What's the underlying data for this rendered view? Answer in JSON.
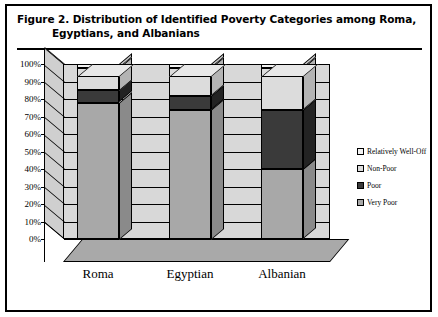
{
  "figure": {
    "title_line1": "Figure 2.  Distribution of Identified Poverty Categories among Roma,",
    "title_line2": "Egyptians, and Albanians"
  },
  "chart_data": {
    "type": "bar",
    "stacked": true,
    "title": "Distribution of Identified Poverty Categories among Roma, Egyptians, and Albanians",
    "xlabel": "",
    "ylabel": "",
    "ylim": [
      0,
      100
    ],
    "y_unit": "%",
    "grid": true,
    "legend_position": "right",
    "categories": [
      "Roma",
      "Egyptian",
      "Albanian"
    ],
    "tick_labels": [
      "0%",
      "10%",
      "20%",
      "30%",
      "40%",
      "50%",
      "60%",
      "70%",
      "80%",
      "90%",
      "100%"
    ],
    "tick_values": [
      0,
      10,
      20,
      30,
      40,
      50,
      60,
      70,
      80,
      90,
      100
    ],
    "series": [
      {
        "name": "Very Poor",
        "color": "#a8a8a8",
        "values": [
          78,
          74,
          40
        ]
      },
      {
        "name": "Poor",
        "color": "#3a3a3a",
        "values": [
          7,
          8,
          34
        ]
      },
      {
        "name": "Non-Poor",
        "color": "#dcdcdc",
        "values": [
          13,
          16,
          24
        ]
      },
      {
        "name": "Relatively Well-Off",
        "color": "#f2f2f2",
        "values": [
          2,
          2,
          2
        ]
      }
    ],
    "legend": [
      {
        "label": "Relatively Well-Off",
        "color": "#f2f2f2"
      },
      {
        "label": "Non-Poor",
        "color": "#dcdcdc"
      },
      {
        "label": "Poor",
        "color": "#3a3a3a"
      },
      {
        "label": "Very Poor",
        "color": "#a8a8a8"
      }
    ]
  }
}
